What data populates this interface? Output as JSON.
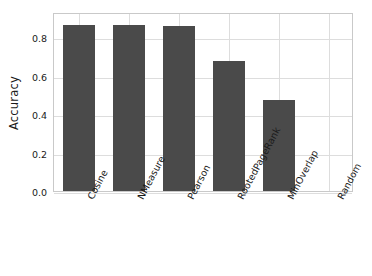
{
  "chart_data": {
    "type": "bar",
    "title": "",
    "xlabel": "",
    "ylabel": "Accuracy",
    "categories": [
      "Cosine",
      "NMeasure",
      "Pearson",
      "RootedPageRank",
      "MinOverlap",
      "Random"
    ],
    "values": [
      0.86,
      0.86,
      0.855,
      0.675,
      0.475,
      0.0
    ],
    "ylim": [
      0.0,
      0.93
    ],
    "yticks": [
      "0.0",
      "0.2",
      "0.4",
      "0.6",
      "0.8"
    ],
    "ytick_values": [
      0.0,
      0.2,
      0.4,
      0.6,
      0.8
    ],
    "grid": true,
    "legend": false,
    "bar_color": "#4a4a4a",
    "grid_color": "#dddddd",
    "frame_color": "#c9c9c9",
    "background": "#ffffff",
    "xtick_rotation": -62
  }
}
